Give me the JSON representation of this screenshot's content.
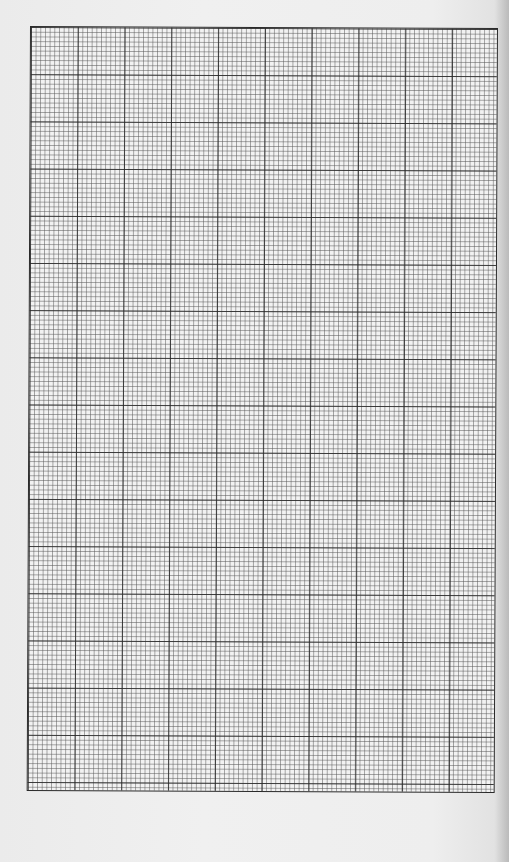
{
  "page": {
    "label": "graph-paper"
  },
  "grid": {
    "major_columns": 10,
    "major_rows": 16,
    "minor_divisions_per_major": 10,
    "line_color": "#2a2a2a",
    "paper_color": "#f0f0f0",
    "background_color": "#ececec"
  }
}
